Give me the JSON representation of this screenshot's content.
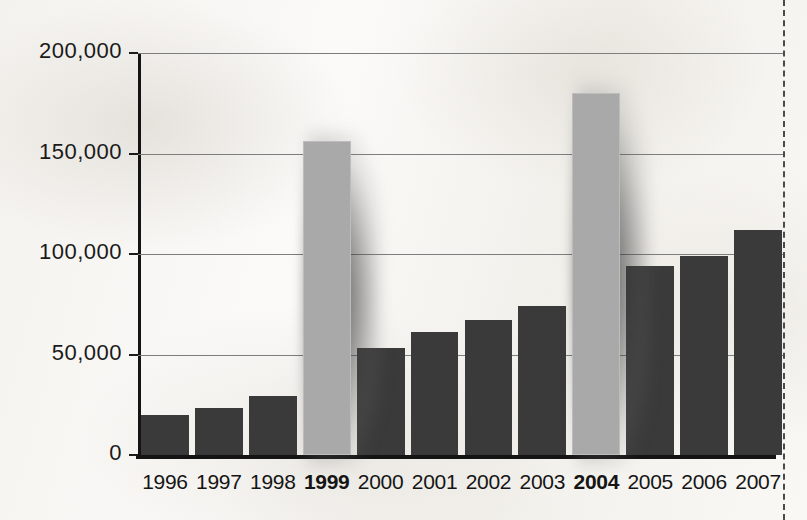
{
  "chart_data": {
    "type": "bar",
    "title": "",
    "subtitle": "",
    "xlabel": "",
    "ylabel": "",
    "categories": [
      "1996",
      "1997",
      "1998",
      "1999",
      "2000",
      "2001",
      "2002",
      "2003",
      "2004",
      "2005",
      "2006",
      "2007"
    ],
    "values": [
      20000,
      23500,
      29500,
      156000,
      53000,
      61000,
      67000,
      74000,
      180000,
      94000,
      99000,
      112000
    ],
    "highlighted_categories": [
      "1999",
      "2004"
    ],
    "ylim": [
      0,
      200000
    ],
    "ytick_labels": [
      "200,000",
      "150,000",
      "100,000",
      "50,000",
      "0"
    ],
    "ytick_values": [
      200000,
      150000,
      100000,
      50000,
      0
    ],
    "grid": "horizontal",
    "legend": "none",
    "colors": {
      "bar": "#3a3a3a",
      "bar_highlight": "#a9a9a9",
      "axis": "#141414",
      "gridline": "#7d7d7d",
      "background": "#f7f6f3",
      "text": "#151515"
    }
  },
  "annotations": {
    "cut_line": "dashed-crop-guide"
  }
}
